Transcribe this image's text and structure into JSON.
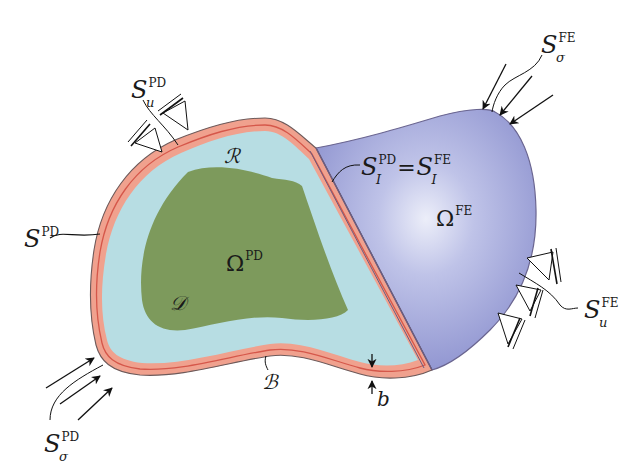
{
  "figure": {
    "type": "coupled peridynamics / finite element domain schematic",
    "colors": {
      "pd_interior_green": "#7d9a5c",
      "pd_region_lightblue": "#b7dde3",
      "boundary_layer_salmon": "#f0a18e",
      "boundary_line_red": "#d5574a",
      "fe_domain_blue": "#9ea3d8",
      "fe_domain_highlight": "#e6e7f6",
      "outline": "#5a5066",
      "ink": "#1a1a1a"
    }
  },
  "labels": {
    "s_u_pd": {
      "base": "S",
      "sub": "u",
      "sup": "PD"
    },
    "s_pd": {
      "base": "S",
      "sup": "PD"
    },
    "region_r": {
      "text": "ℛ"
    },
    "omega_pd": {
      "base": "Ω",
      "sup": "PD"
    },
    "region_d": {
      "text": "𝒟"
    },
    "interface": {
      "left_base": "S",
      "left_sub": "I",
      "left_sup": "PD",
      "equals": "=",
      "right_base": "S",
      "right_sub": "I",
      "right_sup": "FE"
    },
    "omega_fe": {
      "base": "Ω",
      "sup": "FE"
    },
    "s_sigma_fe": {
      "base": "S",
      "sub": "σ",
      "sup": "FE"
    },
    "s_u_fe": {
      "base": "S",
      "sub": "u",
      "sup": "FE"
    },
    "boundary_b": {
      "text": "ℬ"
    },
    "thickness_b": {
      "text": "b"
    },
    "s_sigma_pd": {
      "base": "S",
      "sub": "σ",
      "sup": "PD"
    }
  },
  "symbols": {
    "pd_supports": 2,
    "fe_supports": 3,
    "pd_traction_arrows": 3,
    "fe_traction_arrows": 3
  }
}
